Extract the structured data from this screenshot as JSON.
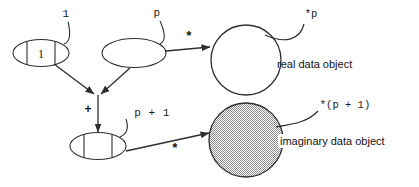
{
  "diagram": {
    "colors": {
      "stroke": "#2e2e2e",
      "text": "#111111",
      "background": "#ffffff",
      "imaginary_fill": "#b8b8b8"
    },
    "nodes": {
      "array_cell_first": {
        "label": "1",
        "cell_text": "1",
        "kind": "array-cell-ellipse",
        "cells": 3,
        "filled": false
      },
      "pointer_var": {
        "label": "p",
        "cell_text": "",
        "kind": "plain-ellipse",
        "filled": false
      },
      "array_cell_second": {
        "label": "p + 1",
        "cell_text": "",
        "kind": "array-cell-ellipse",
        "cells": 3,
        "filled": false
      },
      "real_object": {
        "label": "*p",
        "caption": "real data object",
        "kind": "circle",
        "filled": false
      },
      "imaginary_object": {
        "label": "*(p + 1)",
        "caption": "imaginary data object",
        "kind": "circle",
        "filled": true
      }
    },
    "edges": {
      "deref_top": {
        "label": "*"
      },
      "deref_bottom": {
        "label": "*"
      },
      "sum_operator": {
        "label": "+"
      }
    }
  }
}
